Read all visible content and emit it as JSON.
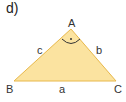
{
  "diagram": {
    "label": "d)",
    "vertices": {
      "A": "A",
      "B": "B",
      "C": "C"
    },
    "sides": {
      "a": "a",
      "b": "b",
      "c": "c"
    },
    "right_angle_at": "A",
    "fill_color": "#fbe3a0",
    "stroke_color": "#e8b84a"
  }
}
